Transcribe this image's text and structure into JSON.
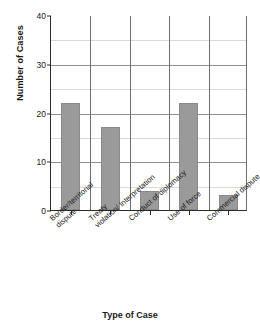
{
  "chart_data": {
    "type": "bar",
    "title": "",
    "xlabel": "Type of Case",
    "ylabel": "Number of Cases",
    "categories": [
      "Border/territorial dispute",
      "Treaty violation/ Interpretation",
      "Conduct of diplomacy",
      "Use of force",
      "Commercial dispute"
    ],
    "category_lines": [
      [
        "Border/territorial",
        "dispute"
      ],
      [
        "Treaty",
        "violation/ Interpretation"
      ],
      [
        "Conduct of diplomacy",
        ""
      ],
      [
        "Use of force",
        ""
      ],
      [
        "Commercial dispute",
        ""
      ]
    ],
    "values": [
      22,
      17,
      4,
      22,
      3
    ],
    "ylim": [
      0,
      40
    ],
    "yticks": [
      0,
      10,
      20,
      30,
      40
    ],
    "ytick_labels": [
      "0",
      "10",
      "20",
      "30",
      "40"
    ],
    "minor_gridlines": [
      5,
      15,
      25,
      35
    ],
    "grid": true,
    "legend": "none",
    "bar_color": "#9a9a9a",
    "axis_color": "#2b2b2b",
    "gridline_color": "#8f8f8f",
    "minor_gridline_color": "#d9d9d9"
  }
}
